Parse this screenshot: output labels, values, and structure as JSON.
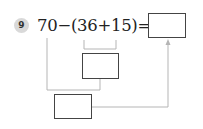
{
  "problem": {
    "number": "9",
    "expression": "70−(36+15)=",
    "operands": [
      "70",
      "36",
      "15"
    ],
    "operators": [
      "−",
      "+"
    ],
    "answer_box_value": "",
    "inner_box_value": "",
    "step_box_value": ""
  },
  "colors": {
    "line": "#b5b5b5",
    "box_border": "#444444",
    "badge_bg": "#d9d9d9"
  }
}
